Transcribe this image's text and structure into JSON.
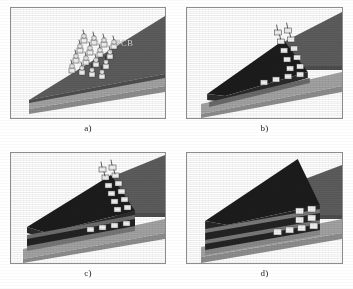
{
  "figure": {
    "kind": "technical-illustration",
    "panel_count": 4,
    "background_color": "#ffffff",
    "frame_border_color": "#8d8d8d"
  },
  "palette": {
    "pcb_board": "#5d5d5d",
    "pcb_board_shade": "#4e4e4e",
    "base_substrate": "#a3a3a3",
    "base_substrate_edge": "#8e8e8e",
    "wedge_dark": "#1c1c1c",
    "wedge_dark_side": "#2b2b2b",
    "layer_dark": "#232323",
    "layer_mid": "#3a3a3a",
    "contact_pad": "#f2f2f2",
    "contact_pad_shade": "#c9c9c9",
    "label_text": "#e4e4e4",
    "caption_text": "#1b1b1b"
  },
  "panels": [
    {
      "id": "a",
      "caption": "a)",
      "label": "PCB",
      "label_visible": true,
      "content_summary": "Bare PCB wedge resting on light substrate with a diagonal array of solder-ball contacts along the board edge",
      "has_contact_array": true,
      "contact_rows": 4,
      "contact_cols": 4,
      "layer_count": 0
    },
    {
      "id": "b",
      "caption": "b)",
      "label": "",
      "label_visible": false,
      "content_summary": "A single dark component layer attached beneath the PCB edge, with contact array on the angled face and a row of pads on the lower board",
      "has_contact_array": true,
      "contact_rows": 5,
      "contact_cols": 2,
      "layer_count": 1
    },
    {
      "id": "c",
      "caption": "c)",
      "label": "",
      "label_visible": false,
      "content_summary": "Two stacked dark layers beneath the PCB edge with the contact array on the angled face and a row of pads below",
      "has_contact_array": true,
      "contact_rows": 6,
      "contact_cols": 2,
      "layer_count": 2
    },
    {
      "id": "d",
      "caption": "d)",
      "label": "",
      "label_visible": false,
      "content_summary": "Three stacked dark layers fully assembled; contacts visible only as small pads at the right edge of each layer",
      "has_contact_array": false,
      "contact_rows": 3,
      "contact_cols": 2,
      "layer_count": 3
    }
  ]
}
